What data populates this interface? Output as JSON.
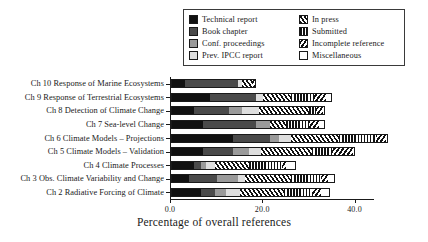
{
  "chart_data": {
    "type": "bar",
    "orientation": "horizontal",
    "stacked": true,
    "title": "",
    "xlabel": "Percentage of overall references",
    "ylabel": "",
    "xlim": [
      0.0,
      44.0
    ],
    "xticks": [
      "0.0",
      "20.0",
      "40.0"
    ],
    "xtick_values": [
      0.0,
      20.0,
      40.0
    ],
    "grid": false,
    "legend_position": "top-right",
    "categories": [
      "Ch 10 Response of Marine Ecosystems",
      "Ch 9 Response of Terrestrial Ecosystems",
      "Ch 8 Detection of Climate Change",
      "Ch 7 Sea-level Change",
      "Ch 6 Climate Models – Projections",
      "Ch 5 Climate Models – Validation",
      "Ch 4 Climate Processes",
      "Ch 3 Obs. Climate Variability and Change",
      "Ch 2 Radiative Forcing of Climate"
    ],
    "series": [
      {
        "name": "Technical report",
        "fill": "f-technical",
        "color": "#111111",
        "values": [
          3.0,
          8.5,
          5.0,
          7.0,
          13.5,
          7.0,
          5.0,
          4.0,
          6.5
        ]
      },
      {
        "name": "Book chapter",
        "fill": "f-book",
        "color": "#4a4a4a",
        "values": [
          11.5,
          10.0,
          7.5,
          11.5,
          8.0,
          6.5,
          1.5,
          6.0,
          3.0
        ]
      },
      {
        "name": "Conf. proceedings",
        "fill": "f-conf",
        "color": "#9a9a9a",
        "values": [
          0.0,
          0.0,
          3.0,
          3.0,
          2.0,
          3.5,
          1.0,
          4.5,
          2.5
        ]
      },
      {
        "name": "Prev. IPCC report",
        "fill": "f-previpcc",
        "color": "#dedede",
        "values": [
          1.0,
          1.5,
          3.5,
          0.0,
          2.5,
          2.5,
          2.0,
          1.5,
          3.0
        ]
      },
      {
        "name": "In press",
        "fill": "f-inpress",
        "color": "#ffffff",
        "values": [
          2.0,
          6.0,
          11.0,
          3.5,
          10.5,
          11.0,
          7.5,
          10.0,
          9.5
        ]
      },
      {
        "name": "Submitted",
        "fill": "f-submitted",
        "color": "#ffffff",
        "values": [
          0.0,
          5.0,
          1.5,
          5.0,
          8.0,
          4.5,
          7.0,
          6.5,
          6.0
        ]
      },
      {
        "name": "Incomplete reference",
        "fill": "f-incomplete",
        "color": "#ffffff",
        "values": [
          1.0,
          2.5,
          1.5,
          2.0,
          2.0,
          4.5,
          1.0,
          1.5,
          2.0
        ]
      },
      {
        "name": "Miscellaneous",
        "fill": "f-misc",
        "color": "#ffffff",
        "values": [
          0.0,
          1.5,
          0.5,
          1.5,
          0.5,
          0.5,
          2.0,
          1.5,
          2.0
        ]
      }
    ],
    "totals": [
      18.5,
      35.0,
      33.5,
      33.5,
      47.0,
      40.0,
      27.0,
      35.5,
      34.5
    ]
  },
  "legend": {
    "entries": [
      {
        "label": "Technical report",
        "swatch": "technical-report-swatch"
      },
      {
        "label": "In press",
        "swatch": "in-press-swatch"
      },
      {
        "label": "Book chapter",
        "swatch": "book-chapter-swatch"
      },
      {
        "label": "Submitted",
        "swatch": "submitted-swatch"
      },
      {
        "label": "Conf. proceedings",
        "swatch": "conf-proceedings-swatch"
      },
      {
        "label": "Incomplete reference",
        "swatch": "incomplete-reference-swatch"
      },
      {
        "label": "Prev. IPCC report",
        "swatch": "prev-ipcc-report-swatch"
      },
      {
        "label": "Miscellaneous",
        "swatch": "miscellaneous-swatch"
      }
    ]
  }
}
